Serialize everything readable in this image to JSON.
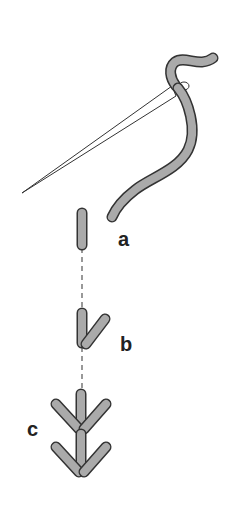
{
  "diagram": {
    "colors": {
      "thread_fill": "#aaaaaa",
      "thread_stroke": "#333333",
      "needle_stroke": "#333333",
      "guide_line": "#555555",
      "background": "#ffffff"
    },
    "labels": [
      {
        "id": "a",
        "text": "a",
        "x": 118,
        "y": 228
      },
      {
        "id": "b",
        "text": "b",
        "x": 120,
        "y": 333
      },
      {
        "id": "c",
        "text": "c",
        "x": 27,
        "y": 418
      }
    ],
    "elements": [
      "needle",
      "thread",
      "stitch-a",
      "stitch-b",
      "stitch-c",
      "guide-line"
    ]
  }
}
